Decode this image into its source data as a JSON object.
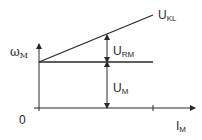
{
  "diagram": {
    "type": "characteristic-line-graph",
    "axes": {
      "y_label_main": "ω",
      "y_label_sub": "M",
      "x_label_main": "I",
      "x_label_sub": "M",
      "origin_label": "0"
    },
    "lines": {
      "sloped": {
        "label_main": "U",
        "label_sub": "KL"
      },
      "horizontal": {
        "label_main": "",
        "label_sub": ""
      }
    },
    "dimensions": {
      "upper": {
        "label_main": "U",
        "label_sub": "RM"
      },
      "lower": {
        "label_main": "U",
        "label_sub": "M"
      }
    },
    "colors": {
      "stroke": "#2a2a2a",
      "background": "#ffffff"
    }
  }
}
